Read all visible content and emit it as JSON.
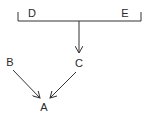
{
  "diagram": {
    "nodes": [
      {
        "id": "D",
        "label": "D",
        "x": 32,
        "y": 13
      },
      {
        "id": "E",
        "label": "E",
        "x": 125,
        "y": 13
      },
      {
        "id": "C",
        "label": "C",
        "x": 79,
        "y": 63
      },
      {
        "id": "B",
        "label": "B",
        "x": 10,
        "y": 62
      },
      {
        "id": "A",
        "label": "A",
        "x": 44,
        "y": 107
      }
    ],
    "edges": [
      {
        "from": "D-E bracket",
        "to": "C"
      },
      {
        "from": "B",
        "to": "A"
      },
      {
        "from": "C",
        "to": "A"
      }
    ],
    "line_color": "#333333"
  }
}
